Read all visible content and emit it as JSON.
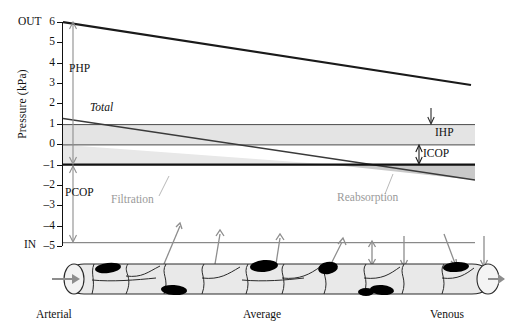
{
  "figure": {
    "axis_title": "Pressure (kPa)",
    "top_endcap": "OUT",
    "bottom_endcap": "IN",
    "y_ticks": [
      "6",
      "5",
      "4",
      "3",
      "2",
      "1",
      "0",
      "–1",
      "–2",
      "–3",
      "–4",
      "–5"
    ],
    "annotations": {
      "php": "PHP",
      "pcop": "PCOP",
      "ihp": "IHP",
      "icop": "ICOP",
      "total": "Total",
      "filtration": "Filtration",
      "reabsorption": "Reabsorption"
    },
    "vessel_labels": {
      "arterial": "Arterial",
      "average": "Average",
      "venous": "Venous"
    },
    "colors": {
      "curve": "#1a1a1a",
      "band_fill": "#e3e3e3",
      "grey_text": "#9a9a9a",
      "arrow_grey": "#8d8d8d",
      "vessel_fill": "#e6e6e6",
      "nucleus": "#000000"
    }
  },
  "chart_data": {
    "type": "line",
    "title": "",
    "xlabel": "",
    "ylabel": "Pressure (kPa)",
    "ylim": [
      -5,
      6
    ],
    "xlim": [
      0,
      1
    ],
    "grid": false,
    "x_tick_labels": [
      "Arterial",
      "Average",
      "Venous"
    ],
    "y_tick_labels": [
      "6",
      "5",
      "4",
      "3",
      "2",
      "1",
      "0",
      "-1",
      "-2",
      "-3",
      "-4",
      "-5"
    ],
    "series": [
      {
        "name": "PHP",
        "description": "Plasma hydrostatic pressure, falls along capillary",
        "x": [
          0,
          1
        ],
        "values": [
          5.7,
          2.6
        ]
      },
      {
        "name": "Total",
        "description": "Net filtration pressure, crosses zero near midpoint",
        "x": [
          0,
          1
        ],
        "values": [
          1.75,
          -0.75
        ]
      },
      {
        "name": "IHP",
        "description": "Interstitial hydrostatic pressure, constant",
        "x": [
          0,
          1
        ],
        "values": [
          1.5,
          1.5
        ]
      },
      {
        "name": "ICOP",
        "description": "Interstitial colloid osmotic pressure, constant",
        "x": [
          0,
          1
        ],
        "values": [
          1.0,
          1.0
        ]
      },
      {
        "name": "Zero line",
        "description": "Baseline reference",
        "x": [
          0,
          1
        ],
        "values": [
          0,
          0
        ]
      },
      {
        "name": "PCOP",
        "description": "Plasma colloid osmotic pressure, constant",
        "x": [
          0,
          1
        ],
        "values": [
          -3.85,
          -3.85
        ]
      }
    ],
    "shaded_regions": [
      {
        "name": "IHP band",
        "from": 1.5,
        "to": 1.0,
        "fill": "#e3e3e3"
      },
      {
        "name": "Filtration",
        "between": [
          "Total",
          "Zero line"
        ],
        "x_range": [
          0,
          0.65
        ],
        "fill": "#e3e3e3"
      },
      {
        "name": "Reabsorption",
        "between": [
          "Zero line",
          "Total"
        ],
        "x_range": [
          0.65,
          1
        ],
        "fill": "#bdbdbd"
      }
    ],
    "measure_arrows": [
      {
        "label": "PHP",
        "from": 0,
        "to": 5.7
      },
      {
        "label": "PCOP",
        "from": 0,
        "to": -3.85
      },
      {
        "label": "IHP",
        "from": 2.0,
        "to": 1.5
      },
      {
        "label": "ICOP",
        "from": 0,
        "to": 1.0
      }
    ],
    "zero_crossing_x": 0.65
  }
}
